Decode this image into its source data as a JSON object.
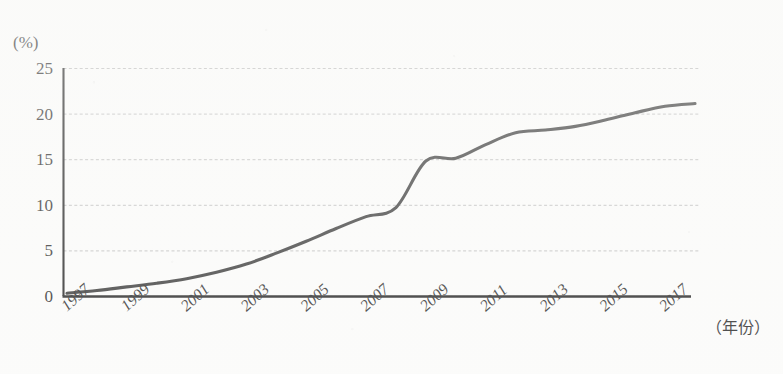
{
  "chart_data": {
    "type": "line",
    "title": "",
    "subtitle": "",
    "xlabel": "（年份）",
    "ylabel": "(%)",
    "ylim": [
      0,
      25
    ],
    "xlim": [
      1997,
      2018
    ],
    "grid": true,
    "legend": false,
    "y_ticks": [
      25,
      20,
      15,
      10,
      5,
      0
    ],
    "x_ticks": [
      1997,
      1999,
      2001,
      2003,
      2005,
      2007,
      2009,
      2011,
      2013,
      2015,
      2017
    ],
    "x": [
      1997,
      1998,
      1999,
      2000,
      2001,
      2002,
      2003,
      2004,
      2005,
      2006,
      2007,
      2008,
      2009,
      2010,
      2011,
      2012,
      2013,
      2014,
      2015,
      2016,
      2017,
      2018
    ],
    "series": [
      {
        "name": "比例",
        "values": [
          0.3,
          0.6,
          1.0,
          1.4,
          1.9,
          2.6,
          3.5,
          4.7,
          6.0,
          7.4,
          8.7,
          9.7,
          14.8,
          15.1,
          16.6,
          17.9,
          18.2,
          18.6,
          19.3,
          20.1,
          20.8,
          21.1
        ]
      }
    ],
    "annotations": []
  },
  "axis": {
    "y_unit_label": "(%)",
    "x_axis_title": "（年份）",
    "y_tick_labels": [
      "25",
      "20",
      "15",
      "10",
      "5",
      "0"
    ],
    "x_tick_labels": [
      "1997",
      "1999",
      "2001",
      "2003",
      "2005",
      "2007",
      "2009",
      "2011",
      "2013",
      "2015",
      "2017"
    ]
  },
  "style": {
    "line_color": "#2b2b2b",
    "axis_color": "#151515",
    "grid_color": "#b9b9b9",
    "background": "#fbfbfa",
    "text_color": "#1a1a1a"
  }
}
